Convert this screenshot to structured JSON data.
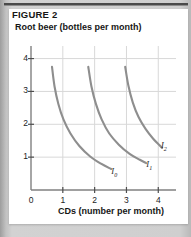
{
  "figure": {
    "number_label": "FIGURE 2",
    "panel_background": "#ffffff",
    "surround_background": "#cfcfcf",
    "rule_color": "#4a4a4a"
  },
  "chart_data": {
    "type": "line",
    "title": "FIGURE 2",
    "xlabel": "CDs (number per month)",
    "ylabel": "Root beer (bottles per month)",
    "xlim": [
      0,
      4.4
    ],
    "ylim": [
      0,
      4.2
    ],
    "xticks": [
      0,
      1,
      2,
      3,
      4
    ],
    "xtick_labels": [
      "0",
      "1",
      "2",
      "3",
      "4"
    ],
    "yticks": [
      1,
      2,
      3,
      4
    ],
    "ytick_labels": [
      "1",
      "2",
      "3",
      "4"
    ],
    "grid": true,
    "grid_color": "#d8d8d8",
    "curve_color": "#8e8e8e",
    "axis_color": "#808080",
    "legend_position": "inline-end-of-curve",
    "series": [
      {
        "name": "I0",
        "label": "I",
        "label_sub": "0",
        "label_x": 2.62,
        "label_y": 0.52,
        "points": [
          {
            "x": 0.66,
            "y": 3.75
          },
          {
            "x": 0.74,
            "y": 3.15
          },
          {
            "x": 0.86,
            "y": 2.62
          },
          {
            "x": 1.02,
            "y": 2.15
          },
          {
            "x": 1.24,
            "y": 1.72
          },
          {
            "x": 1.52,
            "y": 1.34
          },
          {
            "x": 1.86,
            "y": 1.02
          },
          {
            "x": 2.2,
            "y": 0.8
          },
          {
            "x": 2.52,
            "y": 0.64
          }
        ]
      },
      {
        "name": "I1",
        "label": "I",
        "label_sub": "1",
        "label_x": 3.72,
        "label_y": 0.72,
        "points": [
          {
            "x": 1.8,
            "y": 3.75
          },
          {
            "x": 1.9,
            "y": 3.15
          },
          {
            "x": 2.04,
            "y": 2.62
          },
          {
            "x": 2.22,
            "y": 2.15
          },
          {
            "x": 2.46,
            "y": 1.72
          },
          {
            "x": 2.76,
            "y": 1.38
          },
          {
            "x": 3.1,
            "y": 1.1
          },
          {
            "x": 3.42,
            "y": 0.92
          },
          {
            "x": 3.62,
            "y": 0.82
          }
        ]
      },
      {
        "name": "I2",
        "label": "I",
        "label_sub": "2",
        "label_x": 4.18,
        "label_y": 1.3,
        "points": [
          {
            "x": 2.96,
            "y": 3.75
          },
          {
            "x": 3.06,
            "y": 3.18
          },
          {
            "x": 3.2,
            "y": 2.66
          },
          {
            "x": 3.38,
            "y": 2.22
          },
          {
            "x": 3.6,
            "y": 1.86
          },
          {
            "x": 3.84,
            "y": 1.56
          },
          {
            "x": 4.04,
            "y": 1.36
          },
          {
            "x": 4.12,
            "y": 1.28
          }
        ]
      }
    ]
  }
}
